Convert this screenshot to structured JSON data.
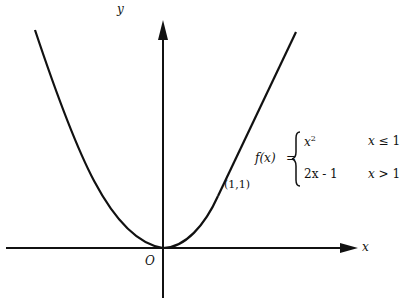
{
  "axes": {
    "x_label": "x",
    "y_label": "y",
    "origin_label": "O"
  },
  "point": {
    "label": "(1,1)"
  },
  "function": {
    "name": "f(x)",
    "equals": "=",
    "cases": [
      {
        "expr": "x",
        "sup": "2",
        "condition_var": "x",
        "condition_op": "≤",
        "condition_val": "1"
      },
      {
        "expr": "2x - 1",
        "condition_var": "x",
        "condition_op": ">",
        "condition_val": "1"
      }
    ]
  }
}
